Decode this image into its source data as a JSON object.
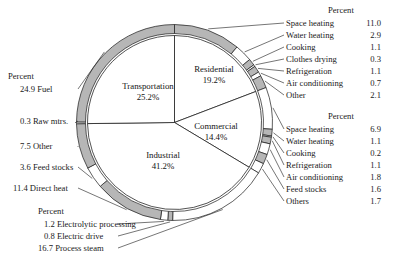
{
  "chart_data": {
    "type": "pie",
    "title": "",
    "units": "Percent",
    "categories": [
      "Transportation",
      "Residential",
      "Commercial",
      "Industrial"
    ],
    "values": [
      25.2,
      19.2,
      14.4,
      41.2
    ],
    "center_labels": [
      {
        "name": "Transportation",
        "value": "25.2%"
      },
      {
        "name": "Residential",
        "value": "19.2%"
      },
      {
        "name": "Commercial",
        "value": "14.4%"
      },
      {
        "name": "Industrial",
        "value": "41.2%"
      }
    ],
    "ring_groups": [
      {
        "group": "Residential",
        "header": "Percent",
        "side": "right-top",
        "items": [
          {
            "label": "Space heating",
            "value": "11.0",
            "num": 11.0
          },
          {
            "label": "Water heating",
            "value": "2.9",
            "num": 2.9
          },
          {
            "label": "Cooking",
            "value": "1.1",
            "num": 1.1
          },
          {
            "label": "Clothes drying",
            "value": "0.3",
            "num": 0.3
          },
          {
            "label": "Refrigeration",
            "value": "1.1",
            "num": 1.1
          },
          {
            "label": "Air conditioning",
            "value": "0.7",
            "num": 0.7
          },
          {
            "label": "Other",
            "value": "2.1",
            "num": 2.1
          }
        ]
      },
      {
        "group": "Commercial",
        "header": "Percent",
        "side": "right-bottom",
        "items": [
          {
            "label": "Space heating",
            "value": "6.9",
            "num": 6.9
          },
          {
            "label": "Water heating",
            "value": "1.1",
            "num": 1.1
          },
          {
            "label": "Cooking",
            "value": "0.2",
            "num": 0.2
          },
          {
            "label": "Refrigeration",
            "value": "1.1",
            "num": 1.1
          },
          {
            "label": "Air conditioning",
            "value": "1.8",
            "num": 1.8
          },
          {
            "label": "Feed stocks",
            "value": "1.6",
            "num": 1.6
          },
          {
            "label": "Others",
            "value": "1.7",
            "num": 1.7
          }
        ]
      },
      {
        "group": "Transportation",
        "header": "Percent",
        "side": "left-top",
        "items": [
          {
            "label": "Fuel",
            "value": "24.9",
            "num": 24.9
          },
          {
            "label": "Raw mtrs.",
            "value": "0.3",
            "num": 0.3
          }
        ]
      },
      {
        "group": "Industrial",
        "header": "Percent",
        "side": "left-bottom",
        "items": [
          {
            "label": "Other",
            "value": "7.5",
            "num": 7.5
          },
          {
            "label": "Feed stocks",
            "value": "3.6",
            "num": 3.6
          },
          {
            "label": "Direct heat",
            "value": "11.4",
            "num": 11.4
          }
        ]
      },
      {
        "group": "Industrial-bottom",
        "header": "Percent",
        "side": "bottom-left",
        "items": [
          {
            "label": "Electrolytic processing",
            "value": "1.2",
            "num": 1.2
          },
          {
            "label": "Electric drive",
            "value": "0.8",
            "num": 0.8
          },
          {
            "label": "Process steam",
            "value": "16.7",
            "num": 16.7
          }
        ]
      }
    ]
  },
  "labels": {
    "percent_header": "Percent",
    "res": {
      "h": "Percent",
      "i0": "Space heating",
      "v0": "11.0",
      "i1": "Water heating",
      "v1": "2.9",
      "i2": "Cooking",
      "v2": "1.1",
      "i3": "Clothes drying",
      "v3": "0.3",
      "i4": "Refrigeration",
      "v4": "1.1",
      "i5": "Air conditioning",
      "v5": "0.7",
      "i6": "Other",
      "v6": "2.1"
    },
    "com": {
      "h": "Percent",
      "i0": "Space heating",
      "v0": "6.9",
      "i1": "Water heating",
      "v1": "1.1",
      "i2": "Cooking",
      "v2": "0.2",
      "i3": "Refrigeration",
      "v3": "1.1",
      "i4": "Air conditioning",
      "v4": "1.8",
      "i5": "Feed stocks",
      "v5": "1.6",
      "i6": "Others",
      "v6": "1.7"
    },
    "left": {
      "h": "Percent",
      "l0": "24.9 Fuel",
      "l1": "0.3 Raw mtrs.",
      "l2": "7.5 Other",
      "l3": "3.6 Feed stocks",
      "l4": "11.4 Direct heat"
    },
    "bottom": {
      "h": "Percent",
      "b0": "1.2 Electrolytic processing",
      "b1": "0.8 Electric drive",
      "b2": "16.7 Process steam"
    },
    "center": {
      "t0": "Transportation",
      "t0v": "25.2%",
      "t1": "Residential",
      "t1v": "19.2%",
      "t2": "Commercial",
      "t2v": "14.4%",
      "t3": "Industrial",
      "t3v": "41.2%"
    }
  },
  "colors": {
    "gray_fill": "#b6b6b6",
    "white_fill": "#ffffff",
    "stroke": "#1a1a1a",
    "text": "#1a1a1a"
  }
}
